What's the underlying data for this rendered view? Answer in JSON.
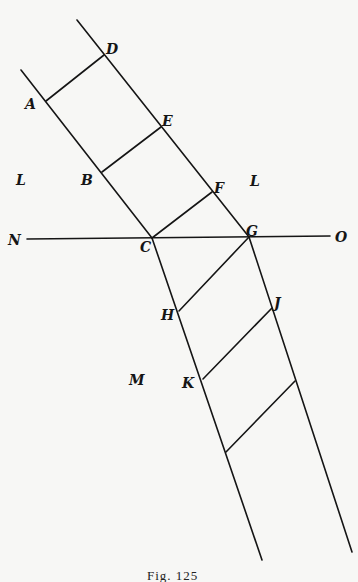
{
  "figure": {
    "caption": "Fig. 125",
    "colors": {
      "ink": "#151515",
      "paper": "#f7f7f5"
    },
    "labels": {
      "A": "A",
      "B": "B",
      "C": "C",
      "D": "D",
      "E": "E",
      "F": "F",
      "G": "G",
      "H": "H",
      "J": "J",
      "K": "K",
      "L_left": "L",
      "L_right": "L",
      "M": "M",
      "N": "N",
      "O": "O"
    },
    "lines": [
      {
        "name": "left-line-upper",
        "from": [
          21,
          70
        ],
        "to": [
          152,
          238
        ]
      },
      {
        "name": "left-line-lower",
        "from": [
          152,
          238
        ],
        "to": [
          262,
          560
        ]
      },
      {
        "name": "right-line-upper",
        "from": [
          77,
          20
        ],
        "to": [
          249,
          237
        ]
      },
      {
        "name": "right-line-lower",
        "from": [
          249,
          237
        ],
        "to": [
          352,
          552
        ]
      },
      {
        "name": "horizontal-line-NO",
        "from": [
          27,
          239
        ],
        "to": [
          330,
          236
        ]
      },
      {
        "name": "segment-AD",
        "from": [
          46,
          101
        ],
        "to": [
          104,
          55
        ]
      },
      {
        "name": "segment-BE",
        "from": [
          102,
          172
        ],
        "to": [
          161,
          127
        ]
      },
      {
        "name": "segment-CF",
        "from": [
          152,
          238
        ],
        "to": [
          212,
          192
        ]
      },
      {
        "name": "segment-HG",
        "from": [
          179,
          311
        ],
        "to": [
          249,
          237
        ]
      },
      {
        "name": "segment-KJ",
        "from": [
          203,
          379
        ],
        "to": [
          272,
          308
        ]
      },
      {
        "name": "segment-lower",
        "from": [
          226,
          452
        ],
        "to": [
          295,
          381
        ]
      }
    ]
  }
}
